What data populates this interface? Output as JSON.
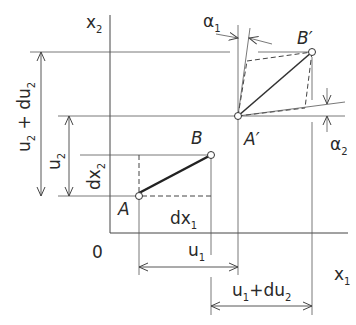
{
  "diagram": {
    "colors": {
      "line": "#2a2a2a",
      "thin": "#555555",
      "background": "#ffffff"
    },
    "axes": {
      "vertical_label": "x",
      "vertical_sub": "2",
      "horizontal_label": "x",
      "horizontal_sub": "1",
      "origin_label": "0"
    },
    "points": {
      "A": "A",
      "B": "B",
      "A_prime": "A′",
      "B_prime": "B′"
    },
    "dimensions": {
      "u2_du2": {
        "main": "u",
        "sub": "2",
        "rest": " + du",
        "sub2": "2"
      },
      "u2": {
        "main": "u",
        "sub": "2"
      },
      "dx2": {
        "main": "dx",
        "sub": "2"
      },
      "dx1": {
        "main": "dx",
        "sub": "1"
      },
      "u1": {
        "main": "u",
        "sub": "1"
      },
      "u1_du2": {
        "main": "u",
        "sub": "1",
        "rest": "+du",
        "sub2": "2"
      }
    },
    "angles": {
      "alpha1": {
        "main": "α",
        "sub": "1"
      },
      "alpha2": {
        "main": "α",
        "sub": "2"
      }
    }
  }
}
